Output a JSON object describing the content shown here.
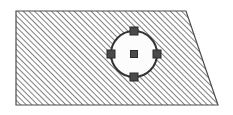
{
  "canvas": {
    "width": 233,
    "height": 115,
    "background": "#ffffff",
    "label": "hatched-polygon-with-circle-selection"
  },
  "shapes": {
    "polygon": {
      "name": "hatched-quadrilateral",
      "type": "polygon",
      "points": "16,11 186,11 218,105 16,105",
      "vertices": [
        {
          "label": "top-left",
          "x": 16,
          "y": 11
        },
        {
          "label": "top-right",
          "x": 186,
          "y": 11
        },
        {
          "label": "bottom-right",
          "x": 218,
          "y": 105
        },
        {
          "label": "bottom-left",
          "x": 16,
          "y": 105
        }
      ],
      "stroke": "#4d4d4d",
      "stroke_width": 1.2,
      "fill": "hatch-45",
      "fill_description": "diagonal hatch lines rising left-to-right"
    },
    "hatch": {
      "name": "diagonal-hatch-pattern",
      "angle_degrees": 45,
      "spacing": 4,
      "line_width": 1.5,
      "line_color": "#555555",
      "background": "#ffffff"
    },
    "circle": {
      "name": "selected-circle",
      "type": "circle",
      "cx": 134,
      "cy": 54,
      "r": 23,
      "fill": "#fcfcfc",
      "stroke": "#333333",
      "stroke_width": 2
    }
  },
  "handles": {
    "name": "selection-handles",
    "size": 8,
    "fill": "#4a4a4a",
    "stroke": "#2a2a2a",
    "stroke_width": 1,
    "items": [
      {
        "label": "handle-center",
        "x": 134,
        "y": 54,
        "size": 7
      },
      {
        "label": "handle-top",
        "x": 134,
        "y": 31,
        "size": 8
      },
      {
        "label": "handle-right",
        "x": 157,
        "y": 54,
        "size": 8
      },
      {
        "label": "handle-bottom",
        "x": 134,
        "y": 77,
        "size": 8
      },
      {
        "label": "handle-left",
        "x": 111,
        "y": 54,
        "size": 8
      }
    ]
  },
  "colors": {
    "outline": "#4d4d4d",
    "hatch_line": "#555555",
    "circle_stroke": "#333333",
    "circle_fill": "#fcfcfc",
    "handle_fill": "#4a4a4a",
    "page_background": "#ffffff"
  }
}
